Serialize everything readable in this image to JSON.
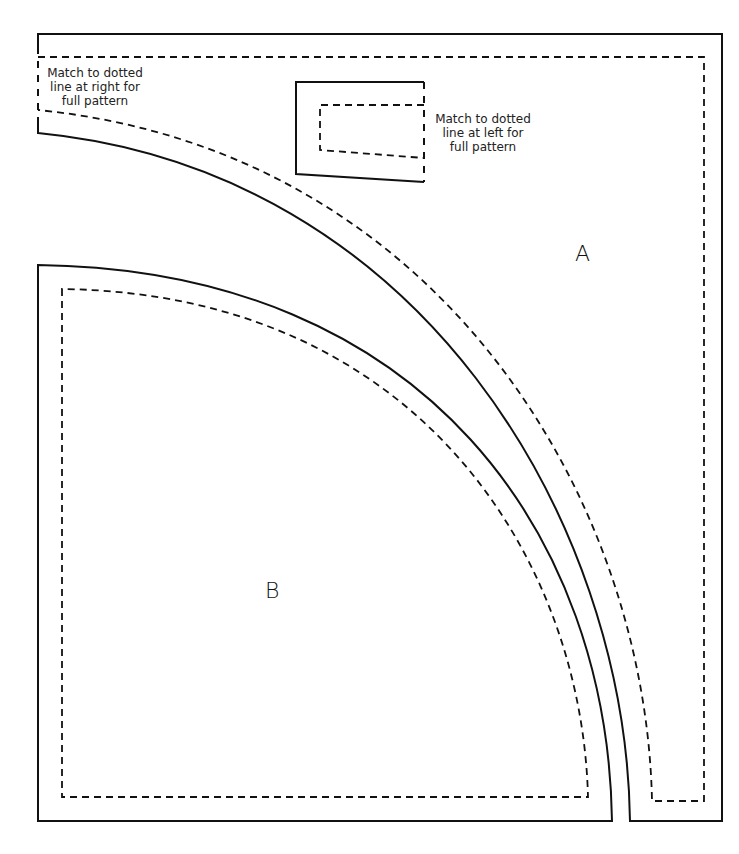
{
  "diagram": {
    "type": "quilt-pattern-template",
    "pieces": [
      {
        "id": "A",
        "label": "A"
      },
      {
        "id": "B",
        "label": "B"
      }
    ],
    "notes": {
      "left": {
        "line1": "Match to dotted",
        "line2": "line at right for",
        "line3": "full pattern"
      },
      "right": {
        "line1": "Match to dotted",
        "line2": "line at left for",
        "line3": "full pattern"
      }
    },
    "colors": {
      "line": "#111111",
      "background": "#ffffff"
    }
  }
}
